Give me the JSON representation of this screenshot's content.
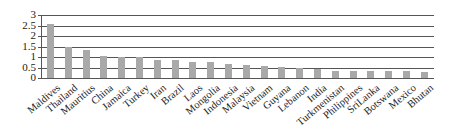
{
  "chart_data": {
    "type": "bar",
    "title": "",
    "xlabel": "",
    "ylabel": "",
    "ylim": [
      0,
      3
    ],
    "yticks": [
      "0",
      "0.5",
      "1",
      "1.5",
      "2",
      "2.5",
      "3"
    ],
    "grid": true,
    "legend": null,
    "bar_color": "#a9a9a9",
    "categories": [
      "Maldives",
      "Thailand",
      "Mauritius",
      "China",
      "Jamaica",
      "Turkey",
      "Iran",
      "Brazil",
      "Laos",
      "Mongolia",
      "Indonesia",
      "Malaysia",
      "Vietnam",
      "Guyana",
      "Lebanon",
      "India",
      "Turkmenistan",
      "Philippines",
      "SriLanka",
      "Botswana",
      "Mexico",
      "Bhutan"
    ],
    "values": [
      2.55,
      1.5,
      1.35,
      1.07,
      1.02,
      0.98,
      0.88,
      0.84,
      0.78,
      0.74,
      0.68,
      0.63,
      0.59,
      0.54,
      0.46,
      0.45,
      0.35,
      0.35,
      0.32,
      0.32,
      0.32,
      0.29
    ]
  }
}
